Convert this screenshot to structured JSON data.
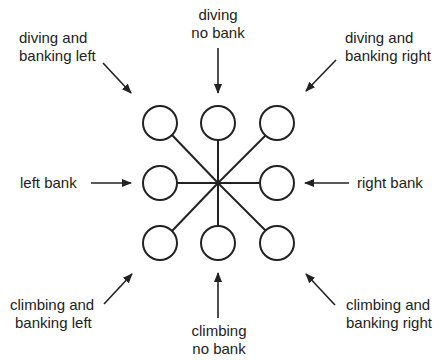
{
  "diagram": {
    "labels": {
      "diving_left": [
        "diving and",
        "banking left"
      ],
      "diving_nobank": [
        "diving",
        "no bank"
      ],
      "diving_right": [
        "diving and",
        "banking right"
      ],
      "left_bank": [
        "left bank"
      ],
      "right_bank": [
        "right bank"
      ],
      "climbing_left": [
        "climbing and",
        "banking left"
      ],
      "climbing_nobank": [
        "climbing",
        "no bank"
      ],
      "climbing_right": [
        "climbing and",
        "banking right"
      ]
    },
    "colors": {
      "stroke": "#222222",
      "background": "#ffffff"
    }
  }
}
